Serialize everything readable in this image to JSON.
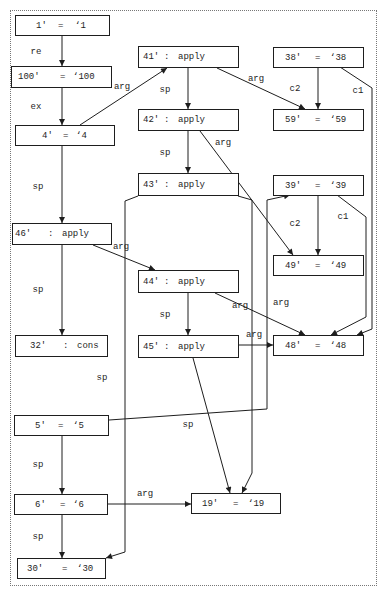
{
  "diagram": {
    "nodes": {
      "n1": {
        "id": "1'",
        "op": "=",
        "value": "‘1"
      },
      "n100": {
        "id": "100'",
        "op": "=",
        "value": "‘100"
      },
      "n4": {
        "id": "4'",
        "op": "=",
        "value": "‘4"
      },
      "n41": {
        "id": "41'",
        "op": ":",
        "value": "apply"
      },
      "n42": {
        "id": "42'",
        "op": ":",
        "value": "apply"
      },
      "n43": {
        "id": "43'",
        "op": ":",
        "value": "apply"
      },
      "n38": {
        "id": "38'",
        "op": "=",
        "value": "‘38"
      },
      "n59": {
        "id": "59'",
        "op": "=",
        "value": "‘59"
      },
      "n39": {
        "id": "39'",
        "op": "=",
        "value": "‘39"
      },
      "n49": {
        "id": "49'",
        "op": "=",
        "value": "‘49"
      },
      "n46": {
        "id": "46'",
        "op": ":",
        "value": "apply"
      },
      "n44": {
        "id": "44'",
        "op": ":",
        "value": "apply"
      },
      "n45": {
        "id": "45'",
        "op": ":",
        "value": "apply"
      },
      "n48": {
        "id": "48'",
        "op": "=",
        "value": "‘48"
      },
      "n32": {
        "id": "32'",
        "op": ":",
        "value": "cons"
      },
      "n5": {
        "id": "5'",
        "op": "=",
        "value": "‘5"
      },
      "n6": {
        "id": "6'",
        "op": "=",
        "value": "‘6"
      },
      "n30": {
        "id": "30'",
        "op": "=",
        "value": "‘30"
      },
      "n19": {
        "id": "19'",
        "op": "=",
        "value": "‘19"
      }
    },
    "edges": [
      {
        "from": "1'",
        "to": "100'",
        "label": "re"
      },
      {
        "from": "100'",
        "to": "4'",
        "label": "ex"
      },
      {
        "from": "4'",
        "to": "41'",
        "label": "arg"
      },
      {
        "from": "41'",
        "to": "42'",
        "label": "sp"
      },
      {
        "from": "41'",
        "to": "59'",
        "label": "arg"
      },
      {
        "from": "38'",
        "to": "59'",
        "label": "c2"
      },
      {
        "from": "38'",
        "to": "48'",
        "label": "c1"
      },
      {
        "from": "42'",
        "to": "43'",
        "label": "sp"
      },
      {
        "from": "42'",
        "to": "49'",
        "label": "arg"
      },
      {
        "from": "4'",
        "to": "46'",
        "label": "sp"
      },
      {
        "from": "39'",
        "to": "49'",
        "label": "c2"
      },
      {
        "from": "39'",
        "to": "48'",
        "label": "c1"
      },
      {
        "from": "46'",
        "to": "44'",
        "label": "arg"
      },
      {
        "from": "46'",
        "to": "32'",
        "label": "sp"
      },
      {
        "from": "5'",
        "to": "39'",
        "label": "arg"
      },
      {
        "from": "44'",
        "to": "48'",
        "label": "arg"
      },
      {
        "from": "44'",
        "to": "45'",
        "label": "sp"
      },
      {
        "from": "45'",
        "to": "48'",
        "label": "arg"
      },
      {
        "from": "43'",
        "to": "30'",
        "label": "sp"
      },
      {
        "from": "43'",
        "to": "19'",
        "label": "sp"
      },
      {
        "from": "5'",
        "to": "6'",
        "label": "sp"
      },
      {
        "from": "6'",
        "to": "19'",
        "label": "arg"
      },
      {
        "from": "6'",
        "to": "30'",
        "label": "sp"
      }
    ]
  }
}
